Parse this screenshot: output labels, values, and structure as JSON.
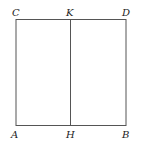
{
  "figure": {
    "type": "geometric-diagram",
    "stroke_color": "#555555",
    "labels": {
      "C": "C",
      "K": "K",
      "D": "D",
      "A": "A",
      "H": "H",
      "B": "B"
    }
  }
}
